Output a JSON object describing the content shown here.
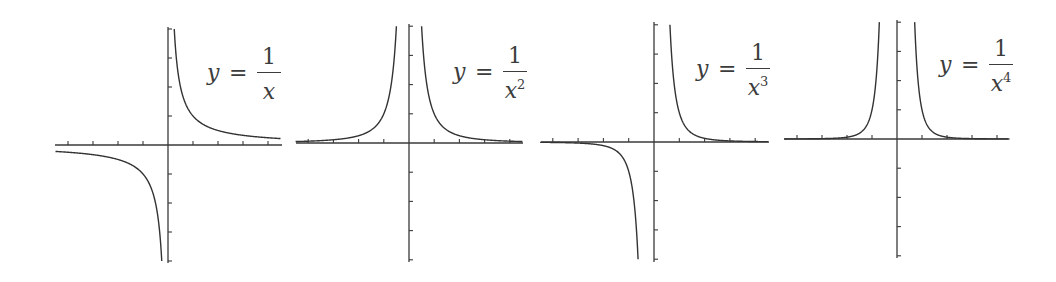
{
  "chart_data": [
    {
      "type": "line",
      "title": "",
      "function": "y = 1/x",
      "label": {
        "lhs": "y",
        "eq": "=",
        "num": "1",
        "den": "x",
        "exp": ""
      },
      "power": 1,
      "xlabel": "",
      "ylabel": "",
      "xlim": [
        -4.5,
        4.5
      ],
      "ylim": [
        -4.1,
        4.1
      ],
      "xticks": [
        -4,
        -3,
        -2,
        -1,
        1,
        2,
        3,
        4
      ],
      "yticks": [
        -4,
        -3,
        -2,
        -1,
        1,
        2,
        3,
        4
      ],
      "grid": false,
      "series": [
        {
          "name": "x>0 branch",
          "x": [
            0.25,
            0.5,
            1,
            2,
            3,
            4,
            4.5
          ],
          "y": [
            4,
            2,
            1,
            0.5,
            0.333,
            0.25,
            0.222
          ]
        },
        {
          "name": "x<0 branch",
          "x": [
            -4.5,
            -4,
            -3,
            -2,
            -1,
            -0.5,
            -0.25
          ],
          "y": [
            -0.222,
            -0.25,
            -0.333,
            -0.5,
            -1,
            -2,
            -4
          ]
        }
      ],
      "layout": {
        "origin": [
          168,
          145
        ],
        "xunit": 25,
        "yunit": 29,
        "xaxis": [
          55,
          282
        ],
        "yaxis": [
          27,
          263
        ],
        "label_pos": [
          207,
          44
        ]
      }
    },
    {
      "type": "line",
      "title": "",
      "function": "y = 1/x^2",
      "label": {
        "lhs": "y",
        "eq": "=",
        "num": "1",
        "den": "x",
        "exp": "2"
      },
      "power": 2,
      "xlabel": "",
      "ylabel": "",
      "xlim": [
        -4.5,
        4.5
      ],
      "ylim": [
        -4.1,
        4.1
      ],
      "xticks": [
        -4,
        -3,
        -2,
        -1,
        1,
        2,
        3,
        4
      ],
      "yticks": [
        -4,
        -3,
        -2,
        -1,
        1,
        2,
        3,
        4
      ],
      "grid": false,
      "series": [
        {
          "name": "x>0 branch",
          "x": [
            0.5,
            1,
            2,
            3,
            4,
            4.5
          ],
          "y": [
            4,
            1,
            0.25,
            0.111,
            0.0625,
            0.049
          ]
        },
        {
          "name": "x<0 branch",
          "x": [
            -4.5,
            -4,
            -3,
            -2,
            -1,
            -0.5
          ],
          "y": [
            0.049,
            0.0625,
            0.111,
            0.25,
            1,
            4
          ]
        }
      ],
      "layout": {
        "origin": [
          409,
          143
        ],
        "xunit": 25.2,
        "yunit": 29.2,
        "xaxis": [
          296,
          523
        ],
        "yaxis": [
          24,
          262
        ],
        "label_pos": [
          453,
          43
        ]
      }
    },
    {
      "type": "line",
      "title": "",
      "function": "y = 1/x^3",
      "label": {
        "lhs": "y",
        "eq": "=",
        "num": "1",
        "den": "x",
        "exp": "3"
      },
      "power": 3,
      "xlabel": "",
      "ylabel": "",
      "xlim": [
        -4.5,
        4.5
      ],
      "ylim": [
        -4.1,
        4.1
      ],
      "xticks": [
        -4,
        -3,
        -2,
        -1,
        1,
        2,
        3,
        4
      ],
      "yticks": [
        -4,
        -3,
        -2,
        -1,
        1,
        2,
        3,
        4
      ],
      "grid": false,
      "series": [
        {
          "name": "x>0 branch",
          "x": [
            0.63,
            1,
            2,
            3,
            4,
            4.5
          ],
          "y": [
            4,
            1,
            0.125,
            0.037,
            0.0156,
            0.011
          ]
        },
        {
          "name": "x<0 branch",
          "x": [
            -4.5,
            -4,
            -3,
            -2,
            -1,
            -0.63
          ],
          "y": [
            -0.011,
            -0.0156,
            -0.037,
            -0.125,
            -1,
            -4
          ]
        }
      ],
      "layout": {
        "origin": [
          654,
          142
        ],
        "xunit": 25.3,
        "yunit": 29.3,
        "xaxis": [
          541,
          769
        ],
        "yaxis": [
          22,
          262
        ],
        "label_pos": [
          696,
          40
        ]
      }
    },
    {
      "type": "line",
      "title": "",
      "function": "y = 1/x^4",
      "label": {
        "lhs": "y",
        "eq": "=",
        "num": "1",
        "den": "x",
        "exp": "4"
      },
      "power": 4,
      "xlabel": "",
      "ylabel": "",
      "xlim": [
        -4.5,
        4.5
      ],
      "ylim": [
        -4.1,
        4.1
      ],
      "xticks": [
        -4,
        -3,
        -2,
        -1,
        1,
        2,
        3,
        4
      ],
      "yticks": [
        -4,
        -3,
        -2,
        -1,
        1,
        2,
        3,
        4
      ],
      "grid": false,
      "series": [
        {
          "name": "x>0 branch",
          "x": [
            0.707,
            1,
            2,
            3,
            4,
            4.5
          ],
          "y": [
            4,
            1,
            0.0625,
            0.0123,
            0.0039,
            0.0024
          ]
        },
        {
          "name": "x<0 branch",
          "x": [
            -4.5,
            -4,
            -3,
            -2,
            -1,
            -0.707
          ],
          "y": [
            0.0024,
            0.0039,
            0.0123,
            0.0625,
            1,
            4
          ]
        }
      ],
      "layout": {
        "origin": [
          897,
          139
        ],
        "xunit": 25,
        "yunit": 29.2,
        "xaxis": [
          784,
          1008
        ],
        "yaxis": [
          20,
          258
        ],
        "label_pos": [
          939,
          36
        ]
      }
    }
  ],
  "colors": {
    "axis": "#3a3a3a",
    "curve": "#333333",
    "label": "#3c3c3c",
    "background": "#ffffff"
  }
}
